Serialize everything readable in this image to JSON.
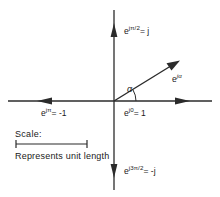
{
  "figure": {
    "background_color": "#ffffff",
    "stroke_color": "#2b2b2b",
    "text_color": "#1a1a1a",
    "width": 220,
    "height": 197
  },
  "axes": {
    "origin": {
      "x": 114,
      "y": 101
    },
    "vertical": {
      "name": "imaginary-axis",
      "top_y": 10,
      "bottom_y": 190,
      "arrow_up": true,
      "arrow_down": true
    },
    "horizontal": {
      "name": "real-axis",
      "left_x": 8,
      "right_x": 212,
      "arrow_left": true,
      "arrow_right": true
    }
  },
  "labels": {
    "positive_imaginary": {
      "base": "e",
      "exponent": "jπ/2",
      "equals": "= j",
      "full": "e^{jπ/2} = j"
    },
    "negative_real": {
      "base": "e",
      "exponent": "jπ",
      "equals": "= -1",
      "full": "e^{jπ} = -1"
    },
    "positive_real": {
      "base": "e",
      "exponent": "j0",
      "equals": "= 1",
      "full": "e^{j0} = 1"
    },
    "negative_imaginary": {
      "base": "e",
      "exponent": "j3π/2",
      "equals": "= -j",
      "full": "e^{j3π/2} = -j"
    },
    "phasor": {
      "base": "e",
      "exponent": "jα",
      "full": "e^{jα}"
    },
    "angle": "α"
  },
  "phasor_vector": {
    "name": "unit-phasor-arrow",
    "from": {
      "x": 114,
      "y": 101
    },
    "to": {
      "x": 179,
      "y": 61
    },
    "magnitude": 1,
    "angle_label": "α"
  },
  "angle_arc": {
    "name": "alpha-angle-arc",
    "radius": 22,
    "start_deg": 0,
    "end_deg": 31
  },
  "scale": {
    "title": "Scale:",
    "caption": "Represents unit length",
    "bar": {
      "x1": 16,
      "x2": 87,
      "y": 144
    },
    "meaning": "unit length"
  }
}
